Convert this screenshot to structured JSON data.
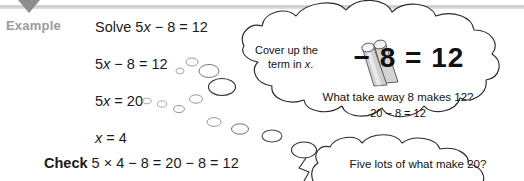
{
  "header": {
    "marker_icon": "triangle-down-icon"
  },
  "example": {
    "label": "Example",
    "solve_line": "Solve 5x − 8 = 12",
    "step1": "5x − 8 = 12",
    "step2": "5x = 20",
    "step3": "x = 4",
    "check_label": "Check",
    "check_line": "5 × 4 − 8 = 20 − 8 = 12"
  },
  "bubble_main": {
    "cover_line1": "Cover up the",
    "cover_line2": "term in x.",
    "cover_icon": "rolled-tubes-icon",
    "big_equation": "− 8 = 12",
    "question": "What take away 8 makes 12?",
    "answer": "20 − 8 = 12"
  },
  "bubble_second": {
    "question": "Five lots of what make 20?"
  },
  "colors": {
    "header_rule": "#d4d4d4",
    "header_marker": "#8d8d8d",
    "example_label": "#9a9a9a",
    "text": "#111111",
    "bubble_outline": "#2a2a2a",
    "tube_fill": "#d9d9d9",
    "tube_edge": "#555555"
  }
}
